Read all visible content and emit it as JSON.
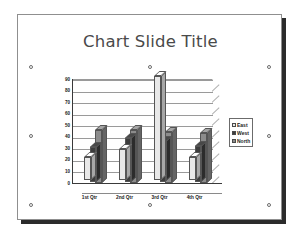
{
  "slide": {
    "title": "Chart Slide Title",
    "background_color": "#ffffff",
    "border_color": "#8f8f8f",
    "shadow_color": "#2b2b2b"
  },
  "chart_object": {
    "selected": true,
    "handle_name": "selection-handle"
  },
  "chart_data": {
    "type": "bar",
    "title": "Chart Slide Title",
    "xlabel": "",
    "ylabel": "",
    "categories": [
      "1st Qtr",
      "2nd Qtr",
      "3rd Qtr",
      "4th Qtr"
    ],
    "series": [
      {
        "name": "East",
        "color": "#e8e8e8",
        "values": [
          20,
          27,
          90,
          20
        ]
      },
      {
        "name": "West",
        "color": "#3d3d3d",
        "values": [
          30,
          38,
          35,
          31
        ]
      },
      {
        "name": "North",
        "color": "#8c8c8c",
        "values": [
          46,
          46,
          44,
          43
        ]
      }
    ],
    "ylim": [
      0,
      90
    ],
    "yticks": [
      90,
      80,
      70,
      60,
      50,
      40,
      30,
      20,
      10,
      0
    ],
    "ytick_labels": [
      "90",
      "80",
      "70",
      "60",
      "50",
      "40",
      "30",
      "20",
      "10",
      "0"
    ],
    "grid": true,
    "legend_position": "right",
    "three_d": true
  }
}
